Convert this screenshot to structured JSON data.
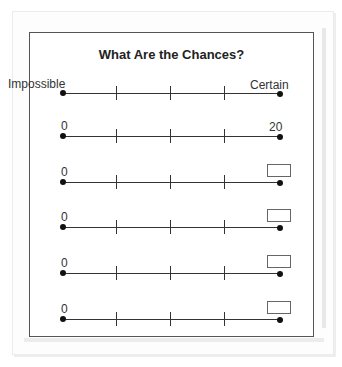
{
  "worksheet": {
    "title": "What Are the Chances?",
    "rows": [
      {
        "left": "Impossible",
        "right": "Certain",
        "right_type": "text"
      },
      {
        "left": "0",
        "right": "20",
        "right_type": "text"
      },
      {
        "left": "0",
        "right": "",
        "right_type": "box"
      },
      {
        "left": "0",
        "right": "",
        "right_type": "box"
      },
      {
        "left": "0",
        "right": "",
        "right_type": "box"
      },
      {
        "left": "0",
        "right": "",
        "right_type": "box"
      }
    ],
    "ticks_per_line": 3
  }
}
